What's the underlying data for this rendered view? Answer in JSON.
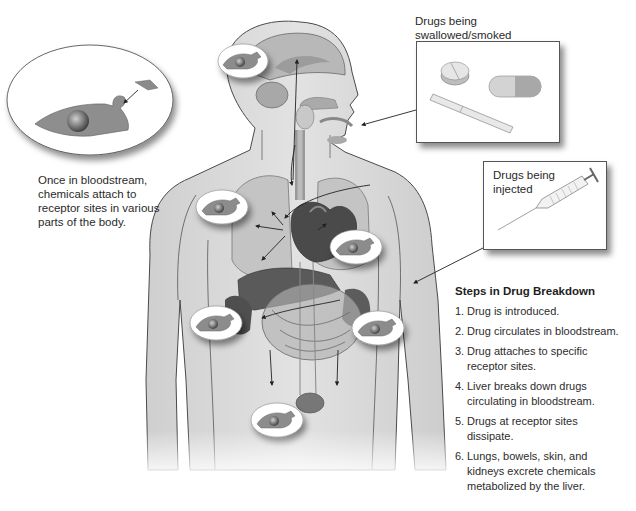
{
  "diagram": {
    "title": "Steps in Drug Breakdown",
    "callouts": {
      "swallowed": {
        "label": "Drugs being swallowed/smoked",
        "items": [
          "pill-icon",
          "capsule-icon",
          "cigarette-icon"
        ]
      },
      "injected": {
        "label": "Drugs being injected",
        "items": [
          "syringe-icon"
        ]
      },
      "receptor": {
        "caption": "Once in bloodstream, chemicals attach to receptor sites in various parts of the body."
      }
    },
    "steps_heading": "Steps in Drug Breakdown",
    "steps": [
      {
        "num": "1.",
        "text": "Drug is introduced."
      },
      {
        "num": "2.",
        "text": "Drug circulates in bloodstream."
      },
      {
        "num": "3.",
        "text": "Drug attaches to specific receptor sites."
      },
      {
        "num": "4.",
        "text": "Liver breaks down drugs circulating in bloodstream."
      },
      {
        "num": "5.",
        "text": "Drugs at receptor sites dissipate."
      },
      {
        "num": "6.",
        "text": "Lungs, bowels, skin, and kidneys excrete chemicals metabolized by the liver."
      }
    ],
    "receptor_sites": [
      "brain",
      "left-shoulder",
      "heart-right",
      "left-hip",
      "right-hip",
      "pelvis"
    ],
    "colors": {
      "body": "#d9d9d9",
      "organ_dark": "#6a6a6a",
      "organ_mid": "#9a9a9a",
      "outline": "#555555",
      "bubble": "#ffffff"
    }
  }
}
